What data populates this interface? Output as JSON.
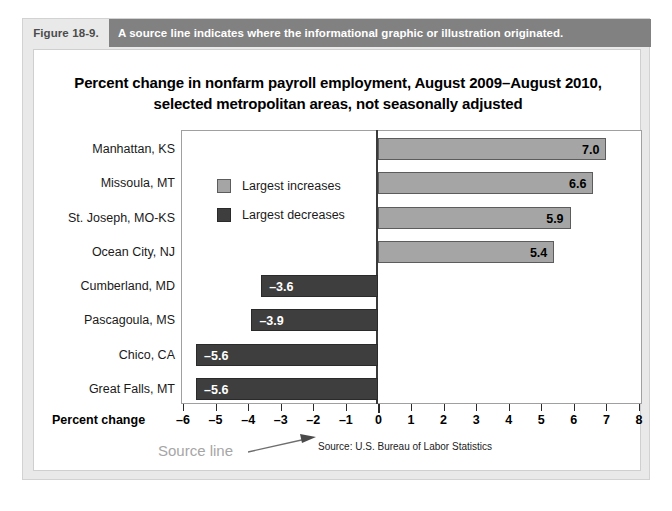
{
  "figure": {
    "number": "Figure 18-9.",
    "caption": "A source line indicates where the informational graphic or illustration originated."
  },
  "chart_data": {
    "type": "bar",
    "orientation": "horizontal",
    "title_line1": "Percent change in nonfarm payroll employment, August 2009–August 2010,",
    "title_line2": "selected metropolitan areas, not seasonally adjusted",
    "xlabel": "Percent change",
    "ylabel": "",
    "xlim": [
      -6,
      8
    ],
    "xticks": [
      -6,
      -5,
      -4,
      -3,
      -2,
      -1,
      0,
      1,
      2,
      3,
      4,
      5,
      6,
      7,
      8
    ],
    "xtick_labels": [
      "–6",
      "–5",
      "–4",
      "–3",
      "–2",
      "–1",
      "0",
      "1",
      "2",
      "3",
      "4",
      "5",
      "6",
      "7",
      "8"
    ],
    "grid": false,
    "legend_position": "inside-left",
    "legend": [
      {
        "label": "Largest increases",
        "color": "#a5a5a5"
      },
      {
        "label": "Largest decreases",
        "color": "#3e3e3e"
      }
    ],
    "categories": [
      "Manhattan, KS",
      "Missoula, MT",
      "St. Joseph, MO-KS",
      "Ocean City, NJ",
      "Cumberland, MD",
      "Pascagoula, MS",
      "Chico, CA",
      "Great Falls, MT"
    ],
    "values": [
      7.0,
      6.6,
      5.9,
      5.4,
      -3.6,
      -3.9,
      -5.6,
      -5.6
    ],
    "value_labels": [
      "7.0",
      "6.6",
      "5.9",
      "5.4",
      "–3.6",
      "–3.9",
      "–5.6",
      "–5.6"
    ],
    "series_of": [
      "increase",
      "increase",
      "increase",
      "increase",
      "decrease",
      "decrease",
      "decrease",
      "decrease"
    ],
    "source": "Source: U.S. Bureau of Labor Statistics",
    "annotation": "Source line"
  },
  "colors": {
    "increase_bar": "#a5a5a5",
    "decrease_bar": "#3e3e3e",
    "caption_bar": "#818181",
    "annotation_text": "#a6a6a6",
    "page_background": "#e9e9e9"
  }
}
